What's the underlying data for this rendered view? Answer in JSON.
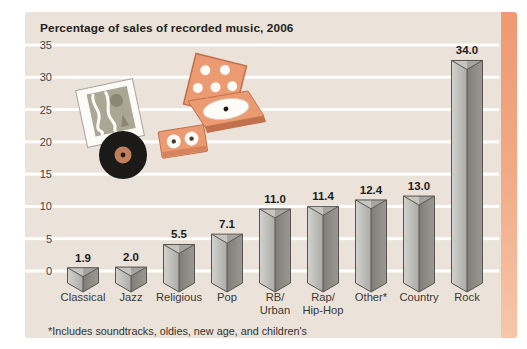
{
  "footnote": "*Includes soundtracks, oldies, new age, and children's",
  "colors": {
    "page_bg": "#ffffff",
    "card_bg": "#ebe2da",
    "gridline": "#ffffff",
    "strip_top": "#ee9a72",
    "strip_mid": "#f1a883",
    "strip_bottom": "#f6c7a9",
    "bar_left_light": "#d3d2cf",
    "bar_left_dark": "#acaba8",
    "bar_right_dark": "#7e7d79",
    "bar_right_light": "#9a9994",
    "bar_top_left": "#c6c5c2",
    "bar_top_right": "#a5a4a0",
    "bar_outline": "#55544e",
    "text_title": "#232220",
    "text_axis": "#45443f",
    "text_value": "#1e1d1b",
    "text_category": "#3a3935",
    "text_foot": "#33322e",
    "illustration_orange": "#ec9a72",
    "illustration_orange_dark": "#c1714b",
    "paper_white": "#fdfbf7",
    "vinyl_black": "#1b1a18",
    "vinyl_label": "#bf7f58",
    "album_art_bg": "#aaa794",
    "album_art_blob": "#8b8773"
  },
  "decorations": [
    {
      "name": "album-cover-icon"
    },
    {
      "name": "vinyl-record-icon"
    },
    {
      "name": "cassette-tape-icon"
    },
    {
      "name": "cd-case-icon"
    }
  ],
  "chart_data": {
    "type": "bar",
    "style": "3d-triangular-prism",
    "title": "Percentage of sales of recorded music, 2006",
    "categories": [
      "Classical",
      "Jazz",
      "Religious",
      "Pop",
      "RB/Urban",
      "Rap/Hip-Hop",
      "Other*",
      "Country",
      "Rock"
    ],
    "category_labels": [
      [
        "Classical"
      ],
      [
        "Jazz"
      ],
      [
        "Religious"
      ],
      [
        "Pop"
      ],
      [
        "RB/",
        "Urban"
      ],
      [
        "Rap/",
        "Hip-Hop"
      ],
      [
        "Other*"
      ],
      [
        "Country"
      ],
      [
        "Rock"
      ]
    ],
    "values": [
      1.9,
      2.0,
      5.5,
      7.1,
      11.0,
      11.4,
      12.4,
      13.0,
      34.0
    ],
    "value_labels": [
      "1.9",
      "2.0",
      "5.5",
      "7.1",
      "11.0",
      "11.4",
      "12.4",
      "13.0",
      "34.0"
    ],
    "xlabel": "",
    "ylabel": "",
    "ylim": [
      0,
      35
    ],
    "yticks": [
      0,
      5,
      10,
      15,
      20,
      25,
      30,
      35
    ],
    "grid": true,
    "legend": null,
    "bar_color": "gray"
  }
}
